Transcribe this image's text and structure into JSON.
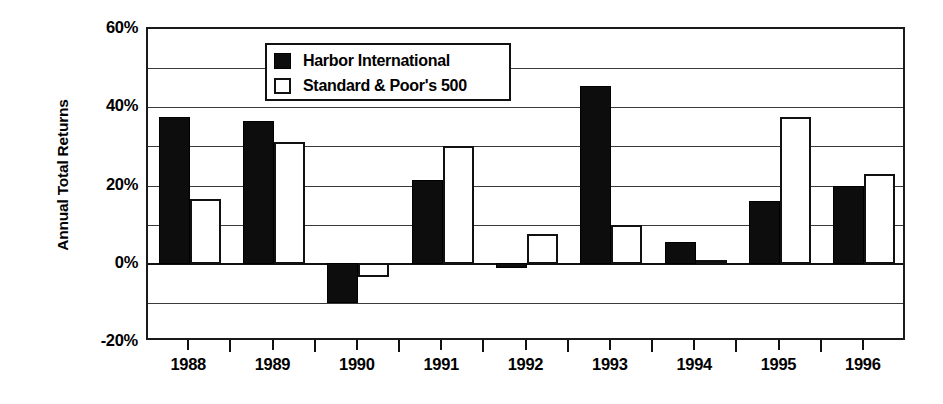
{
  "chart_data": {
    "type": "bar",
    "title": "",
    "xlabel": "",
    "ylabel": "Annual Total Returns",
    "categories": [
      "1988",
      "1989",
      "1990",
      "1991",
      "1992",
      "1993",
      "1994",
      "1995",
      "1996"
    ],
    "series": [
      {
        "name": "Harbor International",
        "color": "#0d0d0d",
        "values": [
          37.5,
          36.5,
          -10.0,
          21.5,
          -1.0,
          45.5,
          5.5,
          16.0,
          20.0
        ]
      },
      {
        "name": "Standard & Poor's 500",
        "color": "#ffffff",
        "values": [
          16.5,
          31.0,
          -3.5,
          30.0,
          7.5,
          10.0,
          1.0,
          37.5,
          23.0
        ]
      }
    ],
    "ylim": [
      -20,
      60
    ],
    "ytick_values": [
      60,
      40,
      20,
      0,
      -20
    ],
    "ytick_labels": [
      "60%",
      "40%",
      "20%",
      "0%",
      "-20%"
    ],
    "gridline_values": [
      60,
      50,
      40,
      30,
      20,
      10,
      0,
      -10,
      -20
    ],
    "grid": true,
    "legend_position": "top-center",
    "legend_entries": [
      {
        "label": "Harbor International",
        "swatch": "filled-black-square"
      },
      {
        "label": "Standard & Poor's 500",
        "swatch": "open-white-square"
      }
    ]
  },
  "axis": {
    "y_title": "Annual Total Returns"
  }
}
